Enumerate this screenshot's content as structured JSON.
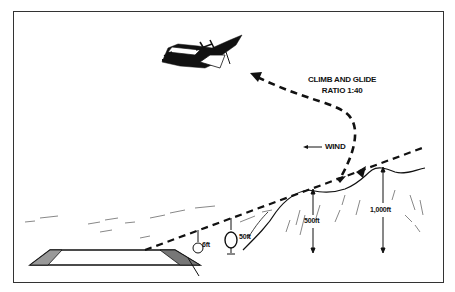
{
  "diagram": {
    "labels": {
      "climb_line1": "CLIMB AND GLIDE",
      "climb_line2": "RATIO 1:40",
      "wind": "WIND",
      "height_6ft": "6ft",
      "height_50ft": "50ft",
      "height_500ft": "500ft",
      "height_1000ft": "1,000ft"
    },
    "icons": {
      "aircraft": "transport-aircraft-icon",
      "wind_arrow": "arrow-left-icon",
      "path_arrow": "arrowhead-icon"
    },
    "colors": {
      "ink": "#111111",
      "frame": "#333333",
      "background": "#ffffff"
    }
  }
}
